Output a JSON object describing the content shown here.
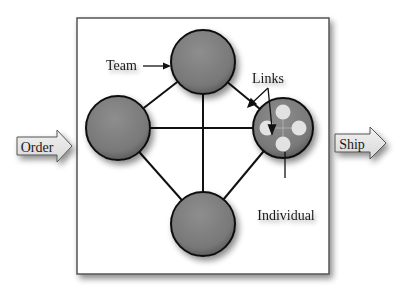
{
  "diagram": {
    "input_label": "Order",
    "output_label": "Ship",
    "annotations": {
      "team": "Team",
      "links": "Links",
      "individual": "Individual"
    },
    "nodes": [
      {
        "id": "top",
        "type": "team-member"
      },
      {
        "id": "left",
        "type": "team-member"
      },
      {
        "id": "right",
        "type": "individual-detail"
      },
      {
        "id": "bottom",
        "type": "team-member"
      }
    ],
    "colors": {
      "node_fill": "#7a7a7a",
      "node_stroke": "#111111",
      "frame_stroke": "#555555",
      "arrow_fill": "#e6e6e6",
      "inner_dot": "#e2e2e2"
    }
  }
}
